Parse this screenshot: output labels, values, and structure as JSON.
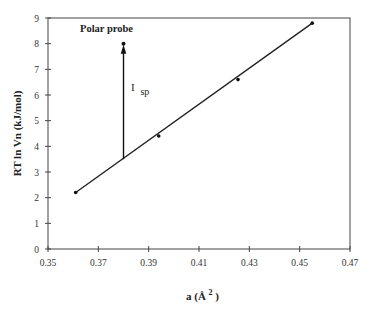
{
  "chart_data": {
    "type": "scatter",
    "title": "",
    "xlabel": "a  (Å²)",
    "ylabel": "RT ln Vn (kJ/mol)",
    "xlim": [
      0.35,
      0.47
    ],
    "ylim": [
      0,
      9
    ],
    "x_ticks": [
      "0.35",
      "0.37",
      "0.39",
      "0.41",
      "0.43",
      "0.45",
      "0.47"
    ],
    "y_ticks": [
      "0",
      "1",
      "2",
      "3",
      "4",
      "5",
      "6",
      "7",
      "8",
      "9"
    ],
    "grid": false,
    "legend": null,
    "series": [
      {
        "name": "n-alkanes reference line",
        "style": "markers with linear fit line",
        "x": [
          0.361,
          0.394,
          0.4255,
          0.455
        ],
        "y": [
          2.2,
          4.4,
          6.6,
          8.8
        ]
      },
      {
        "name": "Polar probe",
        "style": "single marker",
        "x": [
          0.38
        ],
        "y": [
          8.0
        ]
      }
    ],
    "annotations": [
      {
        "text": "Polar probe",
        "x": 0.38,
        "y": 8.6,
        "bold": true
      },
      {
        "text": "I",
        "subscript": "sp",
        "x": 0.3825,
        "y": 6.1,
        "description": "vertical arrow from reference line (y≈3.5) up to polar probe point (y≈8.0) at x=0.38"
      }
    ],
    "arrow": {
      "x": 0.38,
      "y_from": 3.5,
      "y_to": 8.0
    }
  },
  "labels": {
    "ylabel": "RT ln Vn (kJ/mol)",
    "xlabel_main": "a  (Å",
    "xlabel_sup": "2",
    "xlabel_close": ")",
    "polar_probe": "Polar probe",
    "isp_main": "I",
    "isp_sub": "sp"
  }
}
